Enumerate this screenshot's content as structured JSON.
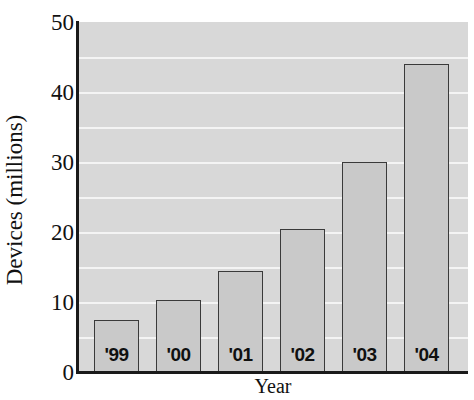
{
  "chart_data": {
    "type": "bar",
    "title": "",
    "xlabel": "Year",
    "ylabel": "Devices (millions)",
    "categories": [
      "'99",
      "'00",
      "'01",
      "'02",
      "'03",
      "'04"
    ],
    "values": [
      7.5,
      10.3,
      14.5,
      20.5,
      30.0,
      44.0
    ],
    "ylim": [
      0,
      50
    ],
    "yticks": [
      0,
      10,
      20,
      30,
      40,
      50
    ],
    "ytick_labels": [
      "0",
      "10",
      "20",
      "30",
      "40",
      "50"
    ],
    "grid": true,
    "grid_minor_step": 5,
    "legend": null,
    "colors": {
      "plot_background": "#d8d8d8",
      "gridline": "#f4f4f4",
      "bar_fill": "#c9c9c9",
      "bar_border": "#3a3a3a",
      "axis": "#1a1a1a",
      "text": "#111111"
    }
  }
}
